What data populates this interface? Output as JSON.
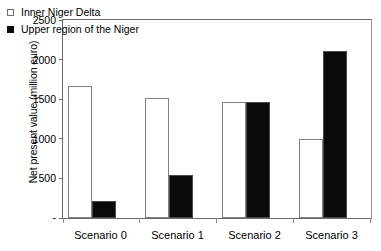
{
  "chart_data": {
    "type": "bar",
    "title": "",
    "xlabel": "",
    "ylabel": "Net present value (million euro)",
    "categories": [
      "Scenario 0",
      "Scenario 1",
      "Scenario 2",
      "Scenario 3"
    ],
    "series": [
      {
        "name": "Inner Niger Delta",
        "style": "open",
        "values": [
          1670,
          1520,
          1470,
          1000
        ]
      },
      {
        "name": "Upper region of the Niger",
        "style": "filled",
        "values": [
          220,
          540,
          1460,
          2115
        ]
      }
    ],
    "ylim": [
      0,
      2500
    ],
    "yticks": [
      0,
      500,
      1000,
      1500,
      2000,
      2500
    ],
    "ytick_labels": [
      "-",
      "500",
      "1000",
      "1500",
      "2000",
      "2500"
    ],
    "grid": false,
    "legend_position": "top-left",
    "colors": {
      "open_fill": "#ffffff",
      "open_edge": "#808080",
      "filled_fill": "#0a0a0a",
      "axis": "#6b6b6b",
      "text": "#000000"
    }
  }
}
